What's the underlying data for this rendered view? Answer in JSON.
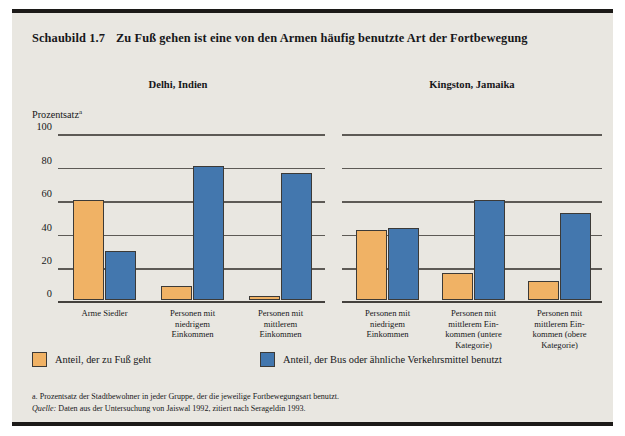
{
  "figure": {
    "number": "Schaubild 1.7",
    "title": "Zu Fuß gehen ist eine von den Armen häufig benutzte Art der Fortbewegung",
    "y_axis_title": "Prozentsatz",
    "y_axis_title_marker": "a",
    "footnote": "a. Prozentsatz der Stadtbewohner in jeder Gruppe, der die jeweilige Fortbewegungsart benutzt.",
    "source_label": "Quelle:",
    "source_text": "Daten aus der Untersuchung von Jaiswal 1992, zitiert nach Serageldin 1993."
  },
  "legend": {
    "walk": "Anteil, der zu Fuß geht",
    "bus": "Anteil, der Bus oder ähnliche Verkehrsmittel benutzt"
  },
  "colors": {
    "walk": "#f0b265",
    "bus": "#4377ae",
    "panel_background": "#e9e7e1",
    "rule": "#1c1a18",
    "gridline": "#5d5a55"
  },
  "chart_data": [
    {
      "type": "bar",
      "title": "Delhi, Indien",
      "xlabel": "",
      "ylabel": "Prozentsatz",
      "ylim": [
        0,
        100
      ],
      "yticks": [
        100,
        80,
        60,
        40,
        20,
        0
      ],
      "grid": true,
      "legend_position": "bottom",
      "categories": [
        "Arme Siedler",
        "Personen mit\nniedrigem\nEinkommen",
        "Personen mit\nmittlerem\nEinkommen"
      ],
      "series": [
        {
          "name": "Anteil, der zu Fuß geht",
          "values": [
            60,
            8,
            2
          ]
        },
        {
          "name": "Anteil, der Bus oder ähnliche Verkehrsmittel benutzt",
          "values": [
            29,
            80,
            76
          ]
        }
      ]
    },
    {
      "type": "bar",
      "title": "Kingston, Jamaika",
      "xlabel": "",
      "ylabel": "Prozentsatz",
      "ylim": [
        0,
        100
      ],
      "yticks": [
        100,
        80,
        60,
        40,
        20,
        0
      ],
      "grid": true,
      "legend_position": "bottom",
      "categories": [
        "Personen mit\nniedrigem\nEinkommen",
        "Personen mit\nmittlerem Ein-\nkommen (untere\nKategorie)",
        "Personen mit\nmittlerem Ein-\nkommen (obere\nKategorie)"
      ],
      "series": [
        {
          "name": "Anteil, der zu Fuß geht",
          "values": [
            42,
            16,
            11
          ]
        },
        {
          "name": "Anteil, der Bus oder ähnliche Verkehrsmittel benutzt",
          "values": [
            43,
            60,
            52
          ]
        }
      ]
    }
  ]
}
